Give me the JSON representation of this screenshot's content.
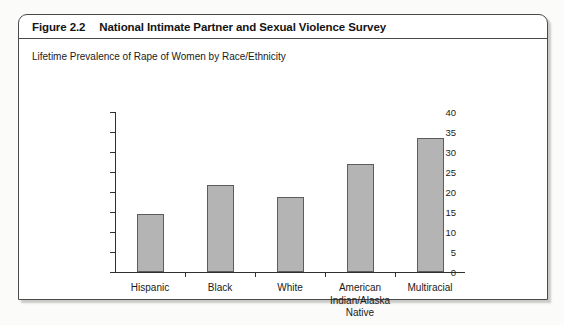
{
  "figure": {
    "label": "Figure 2.2",
    "title": "National Intimate Partner and Sexual Violence Survey",
    "subtitle": "Lifetime Prevalence of Rape of Women by Race/Ethnicity"
  },
  "chart_data": {
    "type": "bar",
    "title": "National Intimate Partner and Sexual Violence Survey",
    "subtitle": "Lifetime Prevalence of Rape of Women by Race/Ethnicity",
    "categories": [
      "Hispanic",
      "Black",
      "White",
      "American\nIndian/Alaska\nNative",
      "Multiracial"
    ],
    "values": [
      14.6,
      21.8,
      18.8,
      27.0,
      33.5
    ],
    "xlabel": "",
    "ylabel": "",
    "ylim": [
      0,
      40
    ],
    "yticks": [
      0,
      5,
      10,
      15,
      20,
      25,
      30,
      35,
      40
    ],
    "ytick_labels": [
      "0",
      "5",
      "10",
      "15",
      "20",
      "25",
      "30",
      "35",
      "40"
    ],
    "grid": false,
    "legend": false,
    "bar_color": "#b4b4b4",
    "bar_edge_color": "#5c5c5c"
  }
}
